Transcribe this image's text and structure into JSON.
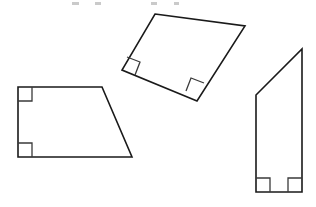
{
  "figure": {
    "title": "Quadrilaterals with Right Angles",
    "background_color": "#ffffff",
    "stroke_color": "#1a1a1a",
    "angle_mark_color": "#3a3a3a",
    "width": 316,
    "height": 207,
    "shape_count": 3,
    "right_angle_mark_count": 6
  },
  "shapes": [
    {
      "id": "left-trapezoid",
      "label": "Left trapezoid",
      "orientation": "upright",
      "vertex_count": 4,
      "right_angle_count": 2,
      "points": "18,87 102,87 132,157 18,157",
      "vertices": [
        {
          "name": "top-left",
          "x": 18,
          "y": 87
        },
        {
          "name": "top-right",
          "x": 102,
          "y": 87
        },
        {
          "name": "bottom-right",
          "x": 132,
          "y": 157
        },
        {
          "name": "bottom-left",
          "x": 18,
          "y": 157
        }
      ],
      "right_angle_marks": [
        {
          "name": "top-left-right-angle",
          "path": "M 18,101 L 32,101 L 32,87"
        },
        {
          "name": "bottom-left-right-angle",
          "path": "M 18,143 L 32,143 L 32,157"
        }
      ]
    },
    {
      "id": "middle-rotated-trapezoid",
      "label": "Middle rotated trapezoid",
      "orientation": "rotated",
      "vertex_count": 4,
      "right_angle_count": 2,
      "points": "155,14 245,26 197,101 122,70",
      "vertices": [
        {
          "name": "top-left",
          "x": 155,
          "y": 14
        },
        {
          "name": "top-right",
          "x": 245,
          "y": 26
        },
        {
          "name": "bottom-right",
          "x": 197,
          "y": 101
        },
        {
          "name": "bottom-left",
          "x": 122,
          "y": 70
        }
      ],
      "right_angle_marks": [
        {
          "name": "lower-left-right-angle",
          "path": "M 127,57 L 140,62 L 135,75"
        },
        {
          "name": "lower-right-right-angle",
          "path": "M 186,91 L 191,78 L 204,83"
        }
      ]
    },
    {
      "id": "right-quadrilateral",
      "label": "Right tall quadrilateral",
      "orientation": "upright",
      "vertex_count": 4,
      "right_angle_count": 2,
      "points": "256,95 302,49 302,192 256,192",
      "vertices": [
        {
          "name": "top-left",
          "x": 256,
          "y": 95
        },
        {
          "name": "apex-top-right",
          "x": 302,
          "y": 49
        },
        {
          "name": "bottom-right",
          "x": 302,
          "y": 192
        },
        {
          "name": "bottom-left",
          "x": 256,
          "y": 192
        }
      ],
      "right_angle_marks": [
        {
          "name": "bottom-left-right-angle",
          "path": "M 256,178 L 270,178 L 270,192"
        },
        {
          "name": "bottom-right-right-angle",
          "path": "M 302,178 L 288,178 L 288,192"
        }
      ]
    }
  ],
  "clipped_text_fragments": [
    {
      "name": "fragment-a",
      "x": 72,
      "y": 2,
      "width": 7,
      "height": 3
    },
    {
      "name": "fragment-b",
      "x": 95,
      "y": 2,
      "width": 6,
      "height": 3
    },
    {
      "name": "fragment-c",
      "x": 151,
      "y": 2,
      "width": 6,
      "height": 3
    },
    {
      "name": "fragment-d",
      "x": 174,
      "y": 2,
      "width": 5,
      "height": 3
    }
  ]
}
